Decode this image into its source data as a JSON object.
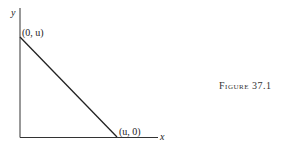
{
  "diagram": {
    "axis_labels": {
      "x": "x",
      "y": "y"
    },
    "points": [
      {
        "label": "(0, u)",
        "coords": [
          0,
          "u"
        ]
      },
      {
        "label": "(u, 0)",
        "coords": [
          "u",
          0
        ]
      }
    ],
    "line": {
      "from": "(0, u)",
      "to": "(u, 0)",
      "color": "#222222"
    },
    "caption": "Figure 37.1"
  }
}
